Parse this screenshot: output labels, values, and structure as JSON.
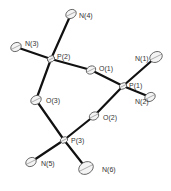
{
  "figure": {
    "type": "ORTEP molecular structure",
    "atoms": [
      {
        "id": "N4",
        "label": "N(4)",
        "x": 71,
        "y": 14,
        "r": 5,
        "lx": 79,
        "ly": 18
      },
      {
        "id": "N3",
        "label": "N(3)",
        "x": 16,
        "y": 47,
        "r": 5,
        "lx": 25,
        "ly": 46
      },
      {
        "id": "P2",
        "label": "P(2)",
        "x": 51,
        "y": 59,
        "r": 3.5,
        "lx": 57,
        "ly": 59
      },
      {
        "id": "O1",
        "label": "O(1)",
        "x": 91,
        "y": 70,
        "r": 4.5,
        "lx": 99,
        "ly": 71
      },
      {
        "id": "N1",
        "label": "N(1)",
        "x": 156,
        "y": 57,
        "r": 6,
        "lx": 135,
        "ly": 61
      },
      {
        "id": "P1",
        "label": "P(1)",
        "x": 123,
        "y": 86,
        "r": 3.5,
        "lx": 129,
        "ly": 88
      },
      {
        "id": "N2",
        "label": "N(2)",
        "x": 150,
        "y": 97,
        "r": 5,
        "lx": 135,
        "ly": 104
      },
      {
        "id": "O3",
        "label": "O(3)",
        "x": 36,
        "y": 100,
        "r": 5,
        "lx": 46,
        "ly": 103
      },
      {
        "id": "O2",
        "label": "O(2)",
        "x": 94,
        "y": 116,
        "r": 4.5,
        "lx": 103,
        "ly": 120
      },
      {
        "id": "P3",
        "label": "P(3)",
        "x": 64,
        "y": 140,
        "r": 3.5,
        "lx": 71,
        "ly": 143
      },
      {
        "id": "N5",
        "label": "N(5)",
        "x": 31,
        "y": 162,
        "r": 5,
        "lx": 41,
        "ly": 166
      },
      {
        "id": "N6",
        "label": "N(6)",
        "x": 86,
        "y": 168,
        "r": 7,
        "lx": 102,
        "ly": 172
      }
    ],
    "bonds": [
      [
        "P2",
        "N4"
      ],
      [
        "P2",
        "N3"
      ],
      [
        "P2",
        "O1"
      ],
      [
        "P2",
        "O3"
      ],
      [
        "O1",
        "P1"
      ],
      [
        "P1",
        "N1"
      ],
      [
        "P1",
        "N2"
      ],
      [
        "P1",
        "O2"
      ],
      [
        "O2",
        "P3"
      ],
      [
        "O3",
        "P3"
      ],
      [
        "P3",
        "N5"
      ],
      [
        "P3",
        "N6"
      ]
    ]
  }
}
